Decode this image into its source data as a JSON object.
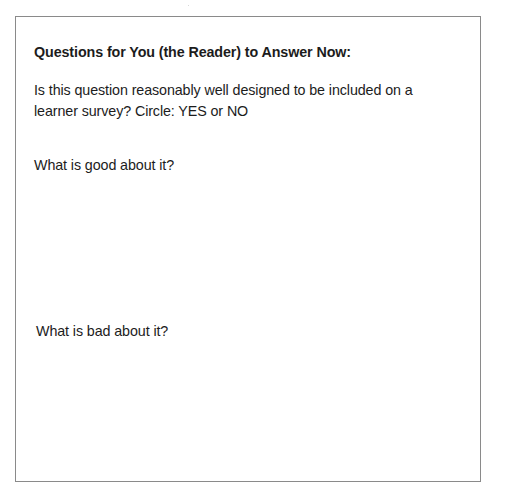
{
  "document": {
    "heading": "Questions for You (the Reader) to Answer Now:",
    "questions": [
      {
        "text": "Is this question reasonably well designed to be included on a learner survey? Circle: YES or NO",
        "options": [
          "YES",
          "NO"
        ]
      },
      {
        "text": "What is good about it?",
        "answer": ""
      },
      {
        "text": "What is bad about it?",
        "answer": ""
      }
    ]
  },
  "colors": {
    "border": "#8a8a8a",
    "text": "#1c1c1c",
    "background": "#ffffff"
  }
}
